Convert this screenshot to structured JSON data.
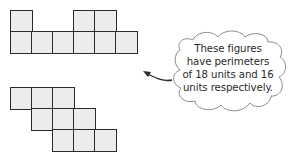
{
  "figures": [
    {
      "name": "figure-top",
      "perimeter_units": 18,
      "origin": [
        10,
        10
      ],
      "cell_size": 21,
      "cells": [
        [
          0,
          0
        ],
        [
          3,
          0
        ],
        [
          4,
          0
        ],
        [
          0,
          1
        ],
        [
          1,
          1
        ],
        [
          2,
          1
        ],
        [
          3,
          1
        ],
        [
          4,
          1
        ],
        [
          5,
          1
        ]
      ]
    },
    {
      "name": "figure-bottom",
      "perimeter_units": 16,
      "origin": [
        10,
        87
      ],
      "cell_size": 21,
      "cells": [
        [
          0,
          0
        ],
        [
          1,
          0
        ],
        [
          2,
          0
        ],
        [
          1,
          1
        ],
        [
          2,
          1
        ],
        [
          3,
          1
        ],
        [
          2,
          2
        ],
        [
          3,
          2
        ],
        [
          4,
          2
        ]
      ]
    }
  ],
  "callout": {
    "lines": [
      "These figures",
      "have perimeters",
      "of 18 units and 16",
      "units respectively."
    ]
  },
  "colors": {
    "cell_fill": "#ececec",
    "cell_stroke": "#2b2b2b",
    "text": "#2a2a2a",
    "cloud_stroke": "#8a8a8a"
  }
}
